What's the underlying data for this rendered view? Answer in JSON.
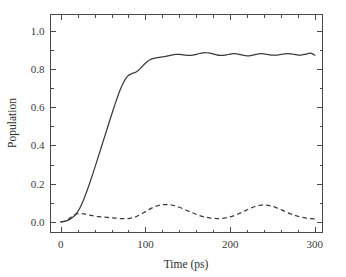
{
  "figure": {
    "background_color": "#ffffff",
    "line_color": "#3a3a3a",
    "axis_color": "#4a4a4a"
  },
  "chart_data": {
    "type": "line",
    "title": "",
    "subtitle": "",
    "xlabel": "Time (ps)",
    "ylabel": "Population",
    "xlim": [
      -12,
      309
    ],
    "ylim": [
      -0.055,
      1.085
    ],
    "xticks": [
      0,
      100,
      200,
      300
    ],
    "xtick_labels": [
      "0",
      "100",
      "200",
      "300"
    ],
    "xticks_minor": [
      20,
      40,
      60,
      80,
      120,
      140,
      160,
      180,
      220,
      240,
      260,
      280,
      300
    ],
    "yticks": [
      0.0,
      0.2,
      0.4,
      0.6,
      0.8,
      1.0
    ],
    "ytick_labels": [
      "0.0",
      "0.2",
      "0.4",
      "0.6",
      "0.8",
      "1.0"
    ],
    "yticks_minor": [
      0.1,
      0.3,
      0.5,
      0.7,
      0.9
    ],
    "grid": false,
    "legend": false,
    "legend_position": "none",
    "tick_direction": "in",
    "frame": true,
    "annotations": [],
    "series": [
      {
        "name": "solid-population",
        "style": "solid",
        "color": "#3a3a3a",
        "x": [
          0,
          3,
          6,
          9,
          12,
          15,
          18,
          21,
          24,
          27,
          30,
          34,
          38,
          42,
          46,
          50,
          54,
          58,
          62,
          66,
          70,
          74,
          78,
          80,
          82,
          84,
          86,
          88,
          90,
          93,
          96,
          99,
          102,
          105,
          108,
          111,
          114,
          117,
          120,
          124,
          128,
          132,
          136,
          140,
          144,
          148,
          152,
          156,
          160,
          164,
          168,
          172,
          176,
          180,
          184,
          188,
          192,
          196,
          200,
          204,
          208,
          212,
          216,
          220,
          224,
          228,
          232,
          236,
          240,
          244,
          248,
          252,
          256,
          260,
          264,
          268,
          272,
          276,
          280,
          284,
          288,
          292,
          296,
          300
        ],
        "y": [
          0.0,
          0.002,
          0.005,
          0.01,
          0.017,
          0.027,
          0.041,
          0.06,
          0.085,
          0.115,
          0.15,
          0.2,
          0.253,
          0.308,
          0.364,
          0.42,
          0.476,
          0.532,
          0.587,
          0.64,
          0.689,
          0.728,
          0.757,
          0.766,
          0.772,
          0.776,
          0.779,
          0.782,
          0.787,
          0.798,
          0.812,
          0.826,
          0.838,
          0.847,
          0.853,
          0.857,
          0.859,
          0.861,
          0.863,
          0.866,
          0.87,
          0.874,
          0.876,
          0.876,
          0.874,
          0.872,
          0.871,
          0.873,
          0.877,
          0.881,
          0.884,
          0.885,
          0.883,
          0.879,
          0.874,
          0.871,
          0.871,
          0.874,
          0.878,
          0.88,
          0.879,
          0.875,
          0.871,
          0.869,
          0.87,
          0.874,
          0.878,
          0.88,
          0.879,
          0.876,
          0.873,
          0.872,
          0.873,
          0.876,
          0.879,
          0.88,
          0.879,
          0.876,
          0.873,
          0.873,
          0.876,
          0.881,
          0.882,
          0.872
        ]
      },
      {
        "name": "dashed-population",
        "style": "dashed",
        "color": "#3a3a3a",
        "x": [
          0,
          4,
          8,
          12,
          16,
          20,
          24,
          28,
          32,
          36,
          40,
          45,
          50,
          55,
          60,
          65,
          70,
          75,
          80,
          85,
          90,
          95,
          100,
          105,
          110,
          115,
          120,
          125,
          130,
          135,
          140,
          145,
          150,
          155,
          160,
          165,
          170,
          175,
          180,
          185,
          190,
          195,
          200,
          205,
          210,
          215,
          220,
          225,
          230,
          235,
          240,
          245,
          250,
          255,
          260,
          265,
          270,
          275,
          280,
          285,
          290,
          295,
          300
        ],
        "y": [
          0.0,
          0.004,
          0.012,
          0.024,
          0.036,
          0.043,
          0.044,
          0.042,
          0.038,
          0.034,
          0.031,
          0.028,
          0.026,
          0.024,
          0.022,
          0.02,
          0.018,
          0.017,
          0.018,
          0.022,
          0.03,
          0.041,
          0.054,
          0.067,
          0.078,
          0.086,
          0.09,
          0.091,
          0.089,
          0.084,
          0.077,
          0.068,
          0.058,
          0.049,
          0.04,
          0.032,
          0.026,
          0.022,
          0.019,
          0.018,
          0.019,
          0.022,
          0.027,
          0.034,
          0.043,
          0.053,
          0.064,
          0.074,
          0.082,
          0.087,
          0.089,
          0.087,
          0.082,
          0.074,
          0.065,
          0.055,
          0.045,
          0.037,
          0.03,
          0.024,
          0.02,
          0.017,
          0.016
        ]
      }
    ]
  }
}
